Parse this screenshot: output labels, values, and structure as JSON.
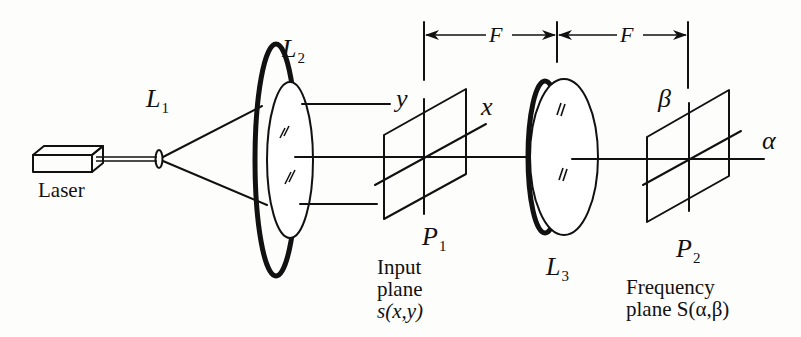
{
  "diagram": {
    "components": {
      "laser": {
        "label": "Laser"
      },
      "lens1": {
        "label_main": "L",
        "label_sub": "1"
      },
      "lens2": {
        "label_main": "L",
        "label_sub": "2"
      },
      "lens3": {
        "label_main": "L",
        "label_sub": "3"
      },
      "plane1": {
        "label_main": "P",
        "label_sub": "1",
        "axis_x": "x",
        "axis_y": "y",
        "caption_line1": "Input",
        "caption_line2": "plane",
        "caption_line3": "s(x,y)"
      },
      "plane2": {
        "label_main": "P",
        "label_sub": "2",
        "axis_alpha": "α",
        "axis_beta": "β",
        "caption_line1": "Frequency",
        "caption_line2": "plane S(α,β)"
      }
    },
    "dimensions": [
      {
        "label": "F",
        "from": "P1",
        "to": "L3"
      },
      {
        "label": "F",
        "from": "L3",
        "to": "P2"
      }
    ],
    "colors": {
      "ink": "#111111",
      "paper": "#fdfdfc"
    }
  }
}
